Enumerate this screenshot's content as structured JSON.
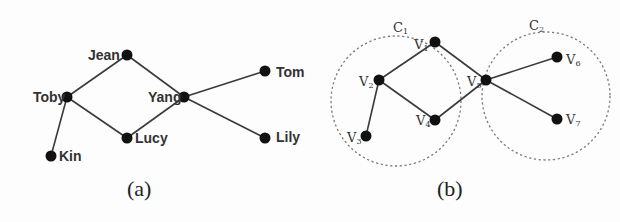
{
  "figure_a": {
    "caption": "(a)",
    "nodes": [
      {
        "id": "jean",
        "label": "Jean",
        "x": 127,
        "y": 55,
        "label_x": 88,
        "label_y": 60
      },
      {
        "id": "toby",
        "label": "Toby",
        "x": 67,
        "y": 97,
        "label_x": 33,
        "label_y": 102
      },
      {
        "id": "yang",
        "label": "Yang",
        "x": 184,
        "y": 97,
        "label_x": 148,
        "label_y": 102
      },
      {
        "id": "tom",
        "label": "Tom",
        "x": 265,
        "y": 71,
        "label_x": 276,
        "label_y": 77
      },
      {
        "id": "lucy",
        "label": "Lucy",
        "x": 127,
        "y": 138,
        "label_x": 135,
        "label_y": 143
      },
      {
        "id": "lily",
        "label": "Lily",
        "x": 265,
        "y": 138,
        "label_x": 276,
        "label_y": 142
      },
      {
        "id": "kin",
        "label": "Kin",
        "x": 51,
        "y": 156,
        "label_x": 59,
        "label_y": 161
      }
    ],
    "edges": [
      [
        "toby",
        "jean"
      ],
      [
        "jean",
        "yang"
      ],
      [
        "toby",
        "lucy"
      ],
      [
        "lucy",
        "yang"
      ],
      [
        "yang",
        "tom"
      ],
      [
        "yang",
        "lily"
      ],
      [
        "toby",
        "kin"
      ]
    ]
  },
  "figure_b": {
    "caption": "(b)",
    "clusters": [
      {
        "id": "c1",
        "label": "C",
        "sub": "1",
        "cx": 396,
        "cy": 101,
        "r": 65,
        "label_x": 393,
        "label_y": 32
      },
      {
        "id": "c2",
        "label": "C",
        "sub": "2",
        "cx": 546,
        "cy": 96,
        "r": 64,
        "label_x": 529,
        "label_y": 30
      }
    ],
    "nodes": [
      {
        "id": "v1",
        "label": "V",
        "sub": "1",
        "x": 435,
        "y": 42,
        "label_x": 414,
        "label_y": 49
      },
      {
        "id": "v2",
        "label": "V",
        "sub": "2",
        "x": 379,
        "y": 80,
        "label_x": 359,
        "label_y": 86
      },
      {
        "id": "v3",
        "label": "V",
        "sub": "3",
        "x": 366,
        "y": 136,
        "label_x": 347,
        "label_y": 142
      },
      {
        "id": "v4",
        "label": "V",
        "sub": "4",
        "x": 435,
        "y": 120,
        "label_x": 416,
        "label_y": 125
      },
      {
        "id": "v5",
        "label": "V",
        "sub": "5",
        "x": 486,
        "y": 80,
        "label_x": 467,
        "label_y": 86
      },
      {
        "id": "v6",
        "label": "V",
        "sub": "6",
        "x": 557,
        "y": 57,
        "label_x": 566,
        "label_y": 64
      },
      {
        "id": "v7",
        "label": "V",
        "sub": "7",
        "x": 557,
        "y": 119,
        "label_x": 566,
        "label_y": 124
      }
    ],
    "edges": [
      [
        "v2",
        "v1"
      ],
      [
        "v1",
        "v5"
      ],
      [
        "v2",
        "v4"
      ],
      [
        "v4",
        "v5"
      ],
      [
        "v5",
        "v6"
      ],
      [
        "v5",
        "v7"
      ],
      [
        "v2",
        "v3"
      ]
    ]
  }
}
